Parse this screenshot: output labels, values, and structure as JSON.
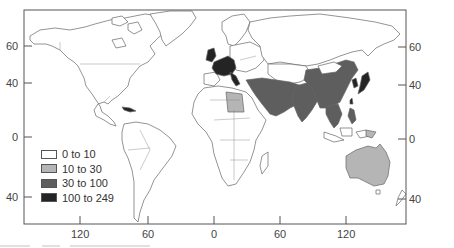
{
  "map": {
    "type": "choropleth world map",
    "projection": "equirectangular",
    "colors": {
      "c1": "#ffffff",
      "c2": "#b5b5b5",
      "c3": "#5e5e5e",
      "c4": "#242424"
    },
    "legend": {
      "items": [
        {
          "label": "0 to 10",
          "class": "c1"
        },
        {
          "label": "10 to 30",
          "class": "c2"
        },
        {
          "label": "30 to 100",
          "class": "c3"
        },
        {
          "label": "100 to 249",
          "class": "c4"
        }
      ]
    },
    "axes": {
      "left": [
        "60",
        "40",
        "0",
        "40"
      ],
      "right": [
        "60",
        "40",
        "0",
        "40"
      ],
      "bottom": [
        "120",
        "60",
        "0",
        "60",
        "120"
      ]
    },
    "shaded_regions": {
      "100 to 249": [
        "United Kingdom",
        "France",
        "Germany",
        "Benelux",
        "Italy",
        "Japan",
        "South Korea",
        "Taiwan"
      ],
      "30 to 100": [
        "Turkey",
        "Iran",
        "Saudi Arabia",
        "Middle East",
        "Afghanistan",
        "Pakistan",
        "India",
        "China",
        "Mongolia (partial)",
        "Myanmar",
        "Thailand",
        "Vietnam",
        "Philippines"
      ],
      "10 to 30": [
        "Libya",
        "Australia"
      ],
      "0 to 10": [
        "Americas",
        "Africa",
        "Russia",
        "Scandinavia",
        "Indonesia",
        "New Zealand"
      ]
    }
  }
}
